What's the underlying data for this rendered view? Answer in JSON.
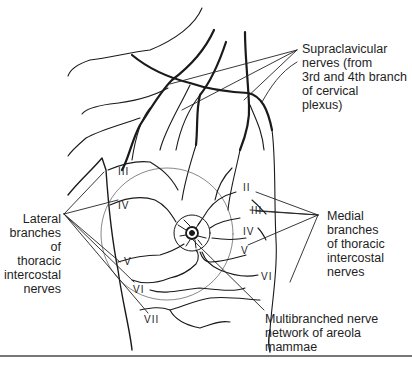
{
  "figure": {
    "labels": {
      "supraclavicular": "Supraclavicular\nnerves (from\n3rd and 4th branch\nof cervical\nplexus)",
      "lateral": "Lateral\nbranches of\nthoracic\nintercostal\nnerves",
      "medial": "Medial branches\nof thoracic\nintercostal\nnerves",
      "areola": "Multibranched nerve\nnetwork of areola\nmammae"
    },
    "lateral_numerals": [
      "III",
      "IV",
      "V",
      "VI",
      "VII"
    ],
    "medial_numerals": [
      "II",
      "III",
      "IV",
      "V",
      "VI"
    ],
    "colors": {
      "line": "#1a1a1a",
      "thin_line": "#333333",
      "rule": "#777777",
      "background": "#ffffff"
    }
  }
}
